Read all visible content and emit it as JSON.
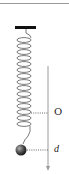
{
  "diagram": {
    "type": "spring-mass system",
    "labels": {
      "equilibrium": "O",
      "displacement": "d"
    },
    "colors": {
      "ceiling": "#111111",
      "spring": "#555555",
      "axis": "#9a9a9a",
      "dotted_line": "#444444",
      "ball_dark": "#1a1a1a",
      "ball_light": "#9a9a9a"
    }
  }
}
